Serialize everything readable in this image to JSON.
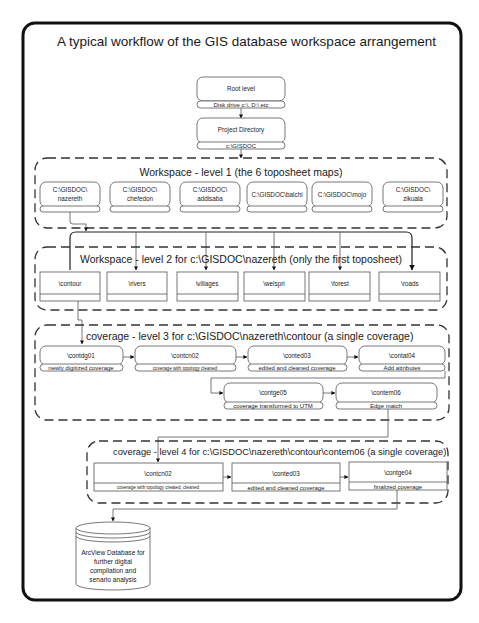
{
  "title": "A typical workflow of the GIS database workspace arrangement",
  "root": {
    "label": "Root level",
    "sublabel": "Disk drive c:\\, D:\\ etc"
  },
  "project": {
    "label": "Project Directory",
    "sublabel": "c:\\GISDOC"
  },
  "level1": {
    "title": "Workspace - level 1 (the 6 toposheet maps)",
    "items": [
      {
        "line1": "C:\\GISDOC\\",
        "line2": "nazereth"
      },
      {
        "line1": "C:\\GISDOC\\",
        "line2": "chefedon"
      },
      {
        "line1": "C:\\GISDOC\\",
        "line2": "addisaba"
      },
      {
        "line1": "C:\\GISDOC\\balchi",
        "line2": ""
      },
      {
        "line1": "C:\\GISDOC\\mojo",
        "line2": ""
      },
      {
        "line1": "C:\\GISDOC\\",
        "line2": "zikuala"
      }
    ]
  },
  "level2": {
    "title": "Workspace - level 2 for c:\\GISDOC\\nazereth (only the first toposheet)",
    "items": [
      "\\contour",
      "\\rivers",
      "\\villages",
      "\\welspri",
      "\\forest",
      "\\roads"
    ]
  },
  "level3": {
    "title": "coverage - level 3 for c:\\GISDOC\\nazereth\\contour (a single coverage)",
    "items": [
      {
        "name": "\\contdg01",
        "desc": "newly digitized coverage"
      },
      {
        "name": "\\contcn02",
        "desc": "coverage with topology  cleaned"
      },
      {
        "name": "\\conted03",
        "desc": "edited and cleaned coverage"
      },
      {
        "name": "\\contat04",
        "desc": "Add attributes"
      },
      {
        "name": "\\contge05",
        "desc": "coverage  transformed to UTM"
      },
      {
        "name": "\\contem06",
        "desc": "Edge match"
      }
    ]
  },
  "level4": {
    "title": "coverage - level 4 for c:\\GISDOC\\nazereth\\contour\\contem06 (a single coverage)",
    "items": [
      {
        "name": "\\contcn02",
        "desc": "coverage with topology created, cleaned"
      },
      {
        "name": "\\conted03",
        "desc": "edited and cleaned coverage"
      },
      {
        "name": "\\contge04",
        "desc": "finalized coverage"
      }
    ]
  },
  "database": {
    "lines": [
      "ArcView Database for",
      "further digital",
      "compilation and",
      "senario analysis"
    ]
  }
}
